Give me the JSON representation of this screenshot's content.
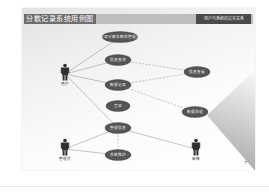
{
  "slide": {
    "title": "分散记录系统用例图",
    "subtitle_box": "用户与系统的交互关系",
    "page_number": "7"
  },
  "actors": [
    {
      "id": "a1",
      "label": "用户",
      "x": 40,
      "y": 64
    },
    {
      "id": "a2",
      "label": "管理员",
      "x": 40,
      "y": 139
    },
    {
      "id": "a3",
      "label": "审核",
      "x": 171,
      "y": 139
    }
  ],
  "use_cases": [
    {
      "id": "u1",
      "label": "记录分散系统的管理员",
      "cx": 98,
      "cy": 29,
      "rx": 18,
      "ry": 5.5
    },
    {
      "id": "u2",
      "label": "信息查询",
      "cx": 96,
      "cy": 52,
      "rx": 13,
      "ry": 5.5
    },
    {
      "id": "u3",
      "label": "数据记录",
      "cx": 96,
      "cy": 77,
      "rx": 13,
      "ry": 5.5
    },
    {
      "id": "u4",
      "label": "登录",
      "cx": 96,
      "cy": 98,
      "rx": 12,
      "ry": 5.5
    },
    {
      "id": "u5",
      "label": "管理信息",
      "cx": 96,
      "cy": 120,
      "rx": 13,
      "ry": 5.5
    },
    {
      "id": "u6",
      "label": "系统维护",
      "cx": 96,
      "cy": 147,
      "rx": 13,
      "ry": 5.5
    },
    {
      "id": "u7",
      "label": "信息查看",
      "cx": 175,
      "cy": 64,
      "rx": 13,
      "ry": 5.5
    },
    {
      "id": "u8",
      "label": "数据处理",
      "cx": 173,
      "cy": 104,
      "rx": 13,
      "ry": 5.5
    }
  ],
  "associations": [
    {
      "from": "a1",
      "to": "u1"
    },
    {
      "from": "a1",
      "to": "u2"
    },
    {
      "from": "a1",
      "to": "u3"
    },
    {
      "from": "a1",
      "to": "u5"
    },
    {
      "from": "a2",
      "to": "u5"
    },
    {
      "from": "a2",
      "to": "u6"
    },
    {
      "from": "a3",
      "to": "u5"
    }
  ],
  "dependencies": [
    {
      "from": "u2",
      "to": "u7"
    },
    {
      "from": "u3",
      "to": "u7"
    },
    {
      "from": "u3",
      "to": "u8"
    },
    {
      "from": "u5",
      "to": "u6"
    }
  ],
  "colors": {
    "ellipse_fill": "#555555",
    "line": "#8a8a8a",
    "title_dark": "#6e6e6e",
    "title_bar": "#bdbdbd"
  }
}
